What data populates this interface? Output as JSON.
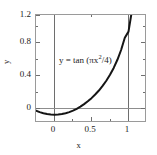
{
  "chart_data": {
    "type": "line",
    "title": "",
    "subtitle": "",
    "xlabel": "x",
    "ylabel": "y",
    "xlim": [
      -0.25,
      1.25
    ],
    "ylim": [
      -0.1,
      1.2
    ],
    "grid": false,
    "legend": null,
    "annotations": [
      {
        "text_prefix": "y = tan (πx",
        "text_exponent": "2",
        "text_suffix": "/4)",
        "full_text": "y = tan (πx²/4)",
        "x": 0.08,
        "y": 0.88
      }
    ],
    "reference_lines": [
      {
        "orientation": "vertical",
        "value": 0,
        "color": "#6e6e6e"
      },
      {
        "orientation": "vertical",
        "value": 1,
        "color": "#6e6e6e"
      },
      {
        "orientation": "horizontal",
        "value": 0,
        "color": "#8d8d8d"
      }
    ],
    "xticks": [
      0,
      0.5,
      1
    ],
    "xticklabels": [
      "0",
      "0.5",
      "1"
    ],
    "xminorticks": [
      -0.25,
      0.25,
      0.75,
      1.25
    ],
    "yticks": [
      0,
      0.4,
      0.8,
      1.2
    ],
    "yticklabels": [
      "0",
      "0.4",
      "0.8",
      "1.2"
    ],
    "yminorticks": [
      0.2,
      0.6,
      1.0
    ],
    "series": [
      {
        "name": "y = tan(πx²/4)",
        "color": "#151515",
        "linewidth": 2.0,
        "x": [
          -0.25,
          -0.2,
          -0.15,
          -0.1,
          -0.05,
          0.0,
          0.05,
          0.1,
          0.15,
          0.2,
          0.25,
          0.3,
          0.35,
          0.4,
          0.45,
          0.5,
          0.55,
          0.6,
          0.65,
          0.7,
          0.75,
          0.8,
          0.85,
          0.9,
          0.95,
          1.0,
          1.05
        ],
        "y": [
          0.049,
          0.031,
          0.018,
          0.008,
          0.002,
          0.0,
          0.002,
          0.008,
          0.018,
          0.031,
          0.049,
          0.071,
          0.097,
          0.127,
          0.161,
          0.199,
          0.243,
          0.291,
          0.346,
          0.409,
          0.48,
          0.563,
          0.661,
          0.779,
          0.927,
          1.0,
          1.273
        ]
      }
    ]
  }
}
